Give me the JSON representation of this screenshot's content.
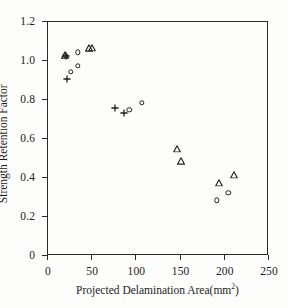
{
  "chart_data": {
    "type": "scatter",
    "title": "",
    "xlabel": "Projected Delamination Area(mm²)",
    "xlabel_base": "Projected Delamination Area(mm",
    "xlabel_sup": "2",
    "xlabel_tail": ")",
    "ylabel": "Strength Retention Factor",
    "xlim": [
      0,
      250
    ],
    "ylim": [
      0,
      1.2
    ],
    "xticks": [
      0,
      50,
      100,
      150,
      200,
      250
    ],
    "xticklabels": [
      "0",
      "50",
      "100",
      "150",
      "200",
      "250"
    ],
    "yticks": [
      0,
      0.2,
      0.4,
      0.6,
      0.8,
      1.0,
      1.2
    ],
    "yticklabels": [
      "0",
      "0.2",
      "0.4",
      "0.6",
      "0.8",
      "1.0",
      "1.2"
    ],
    "grid": false,
    "legend": "none",
    "frame": "box",
    "marker_color": "#1f1f1f",
    "series": [
      {
        "name": "circle-series",
        "marker": "circle",
        "points": [
          {
            "x": 21,
            "y": 1.02
          },
          {
            "x": 35,
            "y": 1.04
          },
          {
            "x": 35,
            "y": 0.97
          },
          {
            "x": 27,
            "y": 0.94
          },
          {
            "x": 93,
            "y": 0.745
          },
          {
            "x": 107,
            "y": 0.78
          },
          {
            "x": 192,
            "y": 0.28
          },
          {
            "x": 205,
            "y": 0.32
          }
        ]
      },
      {
        "name": "triangle-series",
        "marker": "triangle",
        "points": [
          {
            "x": 20,
            "y": 1.025
          },
          {
            "x": 48,
            "y": 1.06
          },
          {
            "x": 51,
            "y": 1.062
          },
          {
            "x": 147,
            "y": 0.545
          },
          {
            "x": 152,
            "y": 0.48
          },
          {
            "x": 195,
            "y": 0.37
          },
          {
            "x": 212,
            "y": 0.41
          }
        ]
      },
      {
        "name": "plus-series",
        "marker": "plus",
        "points": [
          {
            "x": 21,
            "y": 1.022
          },
          {
            "x": 23,
            "y": 0.905
          },
          {
            "x": 77,
            "y": 0.755
          },
          {
            "x": 87,
            "y": 0.73
          }
        ]
      }
    ]
  }
}
